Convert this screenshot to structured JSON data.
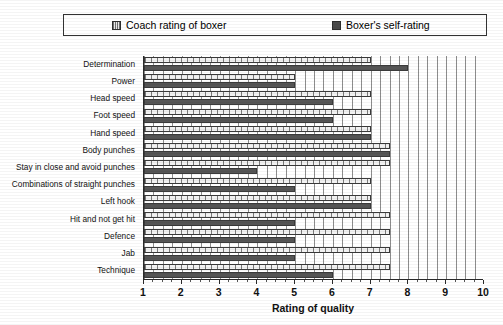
{
  "legend": {
    "items": [
      {
        "label": "Coach rating of boxer",
        "key": "coach",
        "color": "#7a7a7a"
      },
      {
        "label": "Boxer's self-rating",
        "key": "self",
        "color": "#555555"
      }
    ]
  },
  "chart_data": {
    "type": "bar",
    "orientation": "horizontal",
    "title": "",
    "xlabel": "Rating of quality",
    "ylabel": "",
    "xlim": [
      1,
      10
    ],
    "xticks": [
      1,
      2,
      3,
      4,
      5,
      6,
      7,
      8,
      9,
      10
    ],
    "xticklabels": [
      "1",
      "2",
      "3",
      "4",
      "5",
      "6",
      "7",
      "8",
      "9",
      "10"
    ],
    "grid": true,
    "grid_axis": "x",
    "legend_position": "top",
    "categories": [
      "Determination",
      "Power",
      "Head speed",
      "Foot speed",
      "Hand speed",
      "Body punches",
      "Stay in close and avoid punches",
      "Combinations of straight punches",
      "Left hook",
      "Hit and not get hit",
      "Defence",
      "Jab",
      "Technique"
    ],
    "series": [
      {
        "name": "Coach rating of boxer",
        "color": "#7a7a7a",
        "values": [
          7.0,
          5.0,
          7.0,
          7.0,
          7.0,
          7.5,
          7.5,
          7.0,
          7.0,
          7.5,
          7.5,
          7.5,
          7.5
        ]
      },
      {
        "name": "Boxer's self-rating",
        "color": "#555555",
        "values": [
          8.0,
          5.0,
          6.0,
          6.0,
          7.0,
          7.5,
          4.0,
          5.0,
          7.0,
          5.0,
          5.0,
          5.0,
          6.0
        ]
      }
    ]
  }
}
